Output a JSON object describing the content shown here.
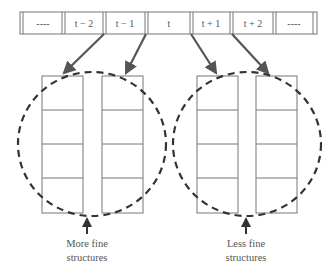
{
  "diagram": {
    "type": "sequence-to-structure mapping",
    "sequence": {
      "cells": [
        {
          "label": "----"
        },
        {
          "label": "t − 2"
        },
        {
          "label": "t − 1"
        },
        {
          "label": "t"
        },
        {
          "label": "t + 1"
        },
        {
          "label": "t + 2"
        },
        {
          "label": "----"
        }
      ]
    },
    "groups": [
      {
        "caption_line1": "More fine",
        "caption_line2": "structures",
        "source_cells": [
          "t − 2",
          "t − 1"
        ],
        "columns": 2,
        "rows_per_column": 4
      },
      {
        "caption_line1": "Less fine",
        "caption_line2": "structures",
        "source_cells": [
          "t + 1",
          "t + 2"
        ],
        "columns": 2,
        "rows_per_column": 4
      }
    ],
    "colors": {
      "line": "#777777",
      "arrow": "#555555",
      "dashed_circle": "#333333",
      "text": "#555555"
    }
  }
}
